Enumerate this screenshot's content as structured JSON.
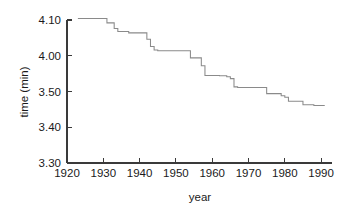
{
  "chart_data": {
    "type": "line",
    "title": "",
    "subtitle": "",
    "xlabel": "year",
    "ylabel": "time (min)",
    "grid": false,
    "legend": "none",
    "line_style": "step-post",
    "line_color": "#8a8a8a",
    "axis_color": "#3a3a3a",
    "background_color": "#ffffff",
    "xlim": [
      1920,
      1993
    ],
    "ylim_seconds": [
      210,
      250
    ],
    "ylim_labels": [
      "3.30",
      "4.10"
    ],
    "xticks": [
      1920,
      1930,
      1940,
      1950,
      1960,
      1970,
      1980,
      1990
    ],
    "xtick_labels": [
      "1920",
      "1930",
      "1940",
      "1950",
      "1960",
      "1970",
      "1980",
      "1990"
    ],
    "yticks_seconds": [
      250,
      240,
      230,
      220,
      210
    ],
    "ytick_labels": [
      "4.10",
      "4.00",
      "3.50",
      "3.40",
      "3.30"
    ],
    "y_value_format": "minutes.seconds",
    "x": [
      1923,
      1931,
      1933,
      1934,
      1937,
      1942,
      1943,
      1944,
      1945,
      1954,
      1957,
      1958,
      1962,
      1964,
      1965,
      1966,
      1967,
      1975,
      1979,
      1980,
      1981,
      1985,
      1988
    ],
    "values_seconds": [
      250.4,
      249.2,
      247.6,
      246.8,
      246.4,
      244.6,
      242.6,
      241.6,
      241.4,
      239.4,
      237.2,
      234.5,
      234.4,
      234.1,
      233.6,
      231.3,
      231.1,
      229.4,
      228.8,
      228.4,
      227.3,
      226.3,
      226.1
    ],
    "values_display": [
      "4.10.4",
      "4.09.2",
      "4.07.6",
      "4.06.8",
      "4.06.4",
      "4.04.6",
      "4.02.6",
      "4.01.6",
      "4.01.4",
      "3.59.4",
      "3.57.2",
      "3.54.5",
      "3.54.4",
      "3.54.1",
      "3.53.6",
      "3.51.3",
      "3.51.1",
      "3.49.4",
      "3.48.8",
      "3.48.4",
      "3.47.3",
      "3.46.3",
      "3.46.1"
    ],
    "series": [
      {
        "name": "mile record time",
        "x": [
          1923,
          1931,
          1933,
          1934,
          1937,
          1942,
          1943,
          1944,
          1945,
          1954,
          1957,
          1958,
          1962,
          1964,
          1965,
          1966,
          1967,
          1975,
          1979,
          1980,
          1981,
          1985,
          1988
        ],
        "values": [
          250.4,
          249.2,
          247.6,
          246.8,
          246.4,
          244.6,
          242.6,
          241.6,
          241.4,
          239.4,
          237.2,
          234.5,
          234.4,
          234.1,
          233.6,
          231.3,
          231.1,
          229.4,
          228.8,
          228.4,
          227.3,
          226.3,
          226.1
        ]
      }
    ],
    "x_end": 1991
  },
  "geometry": {
    "plot_left": 67,
    "plot_right": 332,
    "plot_top": 20,
    "plot_bottom": 163,
    "x_axis_end": 332,
    "tick_len_x": 5,
    "tick_len_y": 5
  }
}
